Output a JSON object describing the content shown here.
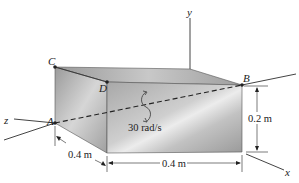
{
  "diagram": {
    "type": "rigid-body-rotation",
    "points": {
      "A": "A",
      "B": "B",
      "C": "C",
      "D": "D"
    },
    "axes": {
      "x": "x",
      "y": "y",
      "z": "z"
    },
    "angular_velocity": "30 rad/s",
    "dimensions": {
      "depth": "0.4 m",
      "length": "0.4 m",
      "height": "0.2 m"
    },
    "colors": {
      "block_front": "#b9b9b9",
      "block_top": "#a6a6a6",
      "block_side": "#9d9d9d",
      "line": "#333333"
    }
  }
}
